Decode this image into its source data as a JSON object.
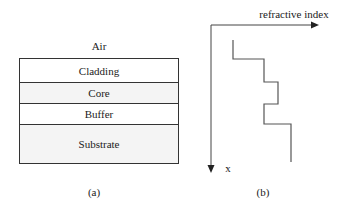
{
  "panel_a": {
    "top_label": "Air",
    "layers": [
      {
        "name": "Cladding",
        "height": 24,
        "pattern": "plain"
      },
      {
        "name": "Core",
        "height": 21,
        "pattern": "dotted"
      },
      {
        "name": "Buffer",
        "height": 21,
        "pattern": "plain"
      },
      {
        "name": "Substrate",
        "height": 38,
        "pattern": "dotted"
      }
    ],
    "caption": "(a)"
  },
  "panel_b": {
    "x_axis_label": "refractive index",
    "y_axis_label": "x",
    "caption": "(b)",
    "profile_regions": [
      "Air",
      "Cladding",
      "Core",
      "Buffer",
      "Substrate"
    ]
  }
}
